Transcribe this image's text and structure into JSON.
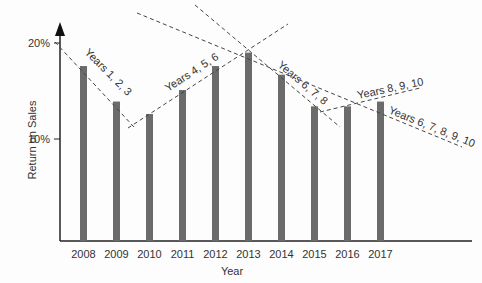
{
  "chart_data": {
    "type": "bar",
    "title": "",
    "xlabel": "Year",
    "ylabel": "Return on Sales",
    "categories": [
      "2008",
      "2009",
      "2010",
      "2011",
      "2012",
      "2013",
      "2014",
      "2015",
      "2016",
      "2017"
    ],
    "values": [
      17.6,
      13.9,
      12.6,
      15.1,
      17.6,
      19.0,
      16.7,
      13.4,
      13.4,
      13.9
    ],
    "yticks": [
      "10%",
      "20%"
    ],
    "ylim": [
      0,
      21
    ],
    "grid": false,
    "bar_color": "#6b6b6b",
    "trend_lines": [
      {
        "label": "Years 1, 2, 3"
      },
      {
        "label": "Years 4, 5, 6"
      },
      {
        "label": "Years 6, 7, 8"
      },
      {
        "label": "Years 8, 9, 10"
      },
      {
        "label": "Years 6, 7, 8, 9, 10"
      }
    ]
  }
}
